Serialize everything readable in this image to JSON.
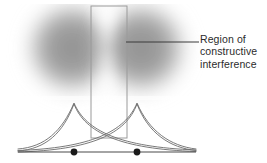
{
  "figure": {
    "name": "wave-interference-diagram",
    "background_color": "#ffffff",
    "width": 267,
    "height": 163,
    "annotation": {
      "lines": [
        "Region of",
        "constructive",
        "interference"
      ],
      "full_text": "Region of constructive interference",
      "text_color": "#2b2b2b",
      "font_size_px": 10.5
    },
    "leader_line": {
      "name": "leader-line",
      "x1": 126,
      "y1": 42,
      "x2": 199,
      "y2": 42,
      "color": "#3a3a3a",
      "width": 1
    },
    "region_box": {
      "name": "constructive-interference-region-box",
      "x": 91,
      "y": 6,
      "width": 36,
      "height": 132,
      "stroke": "#9a9a9a",
      "stroke_width": 1,
      "fill": "none"
    },
    "sources": [
      {
        "name": "wave-source-left",
        "cx": 74,
        "cy": 152,
        "dot_radius": 3.4,
        "color": "#1a1a1a"
      },
      {
        "name": "wave-source-right",
        "cx": 137,
        "cy": 152,
        "dot_radius": 3.4,
        "color": "#1a1a1a"
      }
    ],
    "blobs": [
      {
        "name": "wave-blob-left",
        "cx": 72,
        "cy": 48,
        "rx": 48,
        "ry": 48,
        "color": "#8d8d8d",
        "blur": 9
      },
      {
        "name": "wave-blob-right",
        "cx": 141,
        "cy": 48,
        "rx": 48,
        "ry": 48,
        "color": "#8d8d8d",
        "blur": 9
      }
    ],
    "interference_lens": {
      "name": "constructive-interference-lens",
      "cx": 108,
      "cy": 48,
      "color": "#f4f4f4",
      "blur": 7
    },
    "baseline": {
      "name": "baseline-axis",
      "x1": 18,
      "y1": 152,
      "x2": 196,
      "y2": 152,
      "color": "#4a4a4a",
      "width": 1.2
    },
    "amplitude_curves": {
      "name": "amplitude-profile-curves",
      "stroke": "#6b6b6b",
      "stroke_width": 0.9,
      "peak_left_x": 74,
      "peak_right_x": 137,
      "peak_y": 103,
      "baseline_y": 150,
      "left_extent_x": 18,
      "right_extent_x": 196
    }
  }
}
